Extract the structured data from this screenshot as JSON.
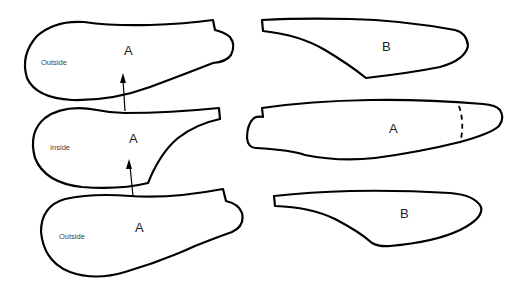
{
  "diagram": {
    "pieces": [
      {
        "id": "left-top",
        "label": "A",
        "side_label": "Outside"
      },
      {
        "id": "left-middle",
        "label": "A",
        "side_label": "Inside"
      },
      {
        "id": "left-bottom",
        "label": "A",
        "side_label": "Outside"
      },
      {
        "id": "right-top",
        "label": "B"
      },
      {
        "id": "right-middle",
        "label": "A",
        "has_dashed_line": true
      },
      {
        "id": "right-bottom",
        "label": "B"
      }
    ],
    "arrows": [
      {
        "from_piece": "left-middle",
        "to_piece": "left-top"
      },
      {
        "from_piece": "left-bottom",
        "to_piece": "left-middle"
      }
    ],
    "colors": {
      "stroke": "#000000",
      "background": "#ffffff"
    }
  }
}
